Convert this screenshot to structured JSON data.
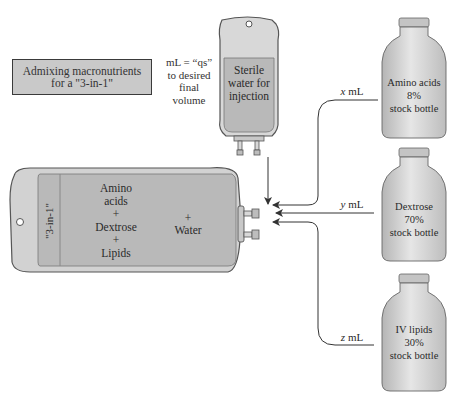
{
  "title_box": {
    "line1": "Admixing macronutrients",
    "line2": "for a \"3-in-1\""
  },
  "qs_note": {
    "line1": "mL = “qs”",
    "line2": "to desired",
    "line3": "final",
    "line4": "volume"
  },
  "sterile_water_bag": {
    "line1": "Sterile",
    "line2": "water for",
    "line3": "injection"
  },
  "main_bag": {
    "side_label": "\"3-in-1\"",
    "contents": [
      "Amino",
      "acids",
      "+",
      "Dextrose",
      "+",
      "Lipids"
    ],
    "water_plus": "+",
    "water_label": "Water"
  },
  "bottles": [
    {
      "name": "Amino acids",
      "concentration": "8%",
      "type": "stock bottle",
      "volume_var": "x",
      "volume_unit": "mL"
    },
    {
      "name": "Dextrose",
      "concentration": "70%",
      "type": "stock bottle",
      "volume_var": "y",
      "volume_unit": "mL"
    },
    {
      "name": "IV lipids",
      "concentration": "30%",
      "type": "stock bottle",
      "volume_var": "z",
      "volume_unit": "mL"
    }
  ],
  "colors": {
    "bag_fill": "#b9b9b9",
    "bag_outline": "#555555",
    "bag_light": "#d8d8d8",
    "bottle_fill": "#cfcfcf",
    "title_box_fill": "#c9c9c9"
  }
}
